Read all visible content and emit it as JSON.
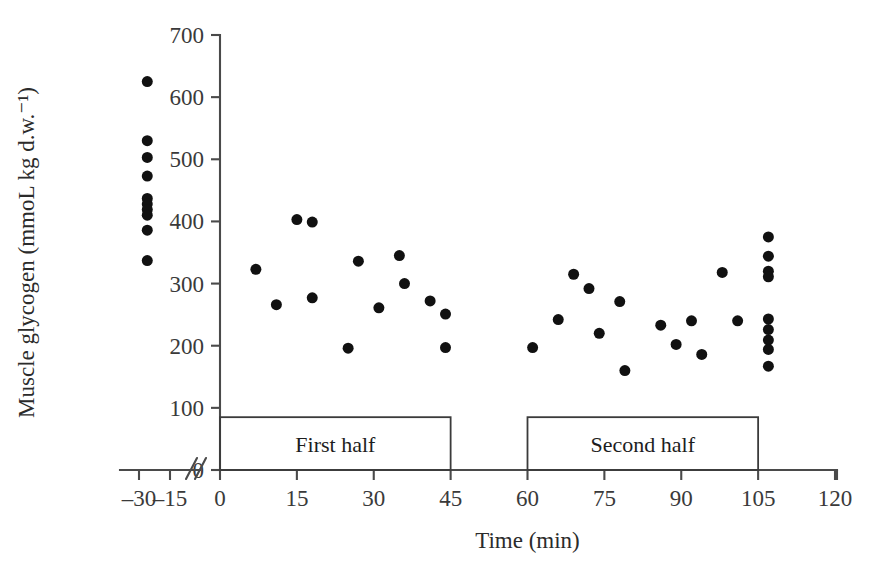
{
  "chart_data": {
    "type": "scatter",
    "title": "",
    "xlabel": "Time (min)",
    "ylabel": "Muscle glycogen (mmoL kg d.w.⁻¹)",
    "xlim": [
      -35,
      120
    ],
    "ylim": [
      0,
      700
    ],
    "grid": false,
    "legend": null,
    "x_ticks": [
      -30,
      -15,
      0,
      15,
      30,
      45,
      60,
      75,
      90,
      105,
      120
    ],
    "x_tick_labels": [
      "–30",
      "–15",
      "0",
      "15",
      "30",
      "45",
      "60",
      "75",
      "90",
      "105",
      "120"
    ],
    "y_ticks": [
      0,
      100,
      200,
      300,
      400,
      500,
      600,
      700
    ],
    "y_tick_labels": [
      "0",
      "100",
      "200",
      "300",
      "400",
      "500",
      "600",
      "700"
    ],
    "axis_break": {
      "present": true,
      "between": [
        -15,
        0
      ],
      "style": "double-slash"
    },
    "marker": {
      "shape": "circle",
      "color": "#111111",
      "size": 11
    },
    "series": [
      {
        "name": "Muscle glycogen",
        "points": [
          {
            "x": -26,
            "y": 625
          },
          {
            "x": -26,
            "y": 530
          },
          {
            "x": -26,
            "y": 503
          },
          {
            "x": -26,
            "y": 473
          },
          {
            "x": -26,
            "y": 437
          },
          {
            "x": -26,
            "y": 428
          },
          {
            "x": -26,
            "y": 419
          },
          {
            "x": -26,
            "y": 410
          },
          {
            "x": -26,
            "y": 386
          },
          {
            "x": -26,
            "y": 337
          },
          {
            "x": 7,
            "y": 323
          },
          {
            "x": 11,
            "y": 266
          },
          {
            "x": 15,
            "y": 403
          },
          {
            "x": 18,
            "y": 399
          },
          {
            "x": 18,
            "y": 277
          },
          {
            "x": 25,
            "y": 196
          },
          {
            "x": 27,
            "y": 336
          },
          {
            "x": 31,
            "y": 261
          },
          {
            "x": 35,
            "y": 345
          },
          {
            "x": 36,
            "y": 300
          },
          {
            "x": 41,
            "y": 272
          },
          {
            "x": 44,
            "y": 251
          },
          {
            "x": 44,
            "y": 197
          },
          {
            "x": 61,
            "y": 197
          },
          {
            "x": 66,
            "y": 242
          },
          {
            "x": 69,
            "y": 315
          },
          {
            "x": 72,
            "y": 292
          },
          {
            "x": 74,
            "y": 220
          },
          {
            "x": 78,
            "y": 271
          },
          {
            "x": 79,
            "y": 160
          },
          {
            "x": 86,
            "y": 233
          },
          {
            "x": 89,
            "y": 202
          },
          {
            "x": 92,
            "y": 240
          },
          {
            "x": 94,
            "y": 186
          },
          {
            "x": 98,
            "y": 318
          },
          {
            "x": 101,
            "y": 240
          },
          {
            "x": 107,
            "y": 375
          },
          {
            "x": 107,
            "y": 344
          },
          {
            "x": 107,
            "y": 320
          },
          {
            "x": 107,
            "y": 311
          },
          {
            "x": 107,
            "y": 243
          },
          {
            "x": 107,
            "y": 226
          },
          {
            "x": 107,
            "y": 209
          },
          {
            "x": 107,
            "y": 194
          },
          {
            "x": 107,
            "y": 167
          }
        ]
      }
    ],
    "annotations": [
      {
        "label": "First half",
        "x_start": 0,
        "x_end": 45,
        "y_top": 85,
        "y_bottom": 0
      },
      {
        "label": "Second half",
        "x_start": 60,
        "x_end": 105,
        "y_top": 85,
        "y_bottom": 0
      }
    ]
  }
}
